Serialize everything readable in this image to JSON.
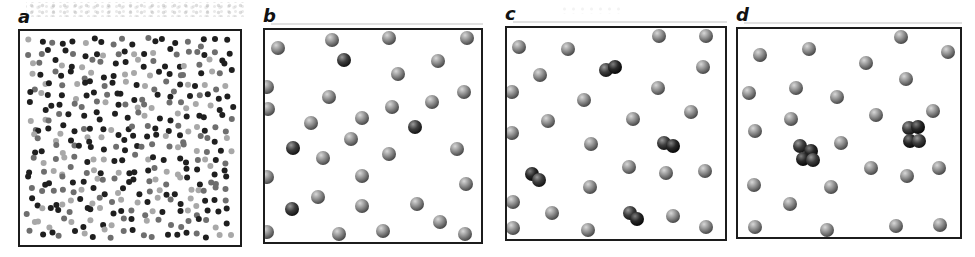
{
  "figure": {
    "width": 975,
    "height": 257,
    "colors": {
      "background": "#ffffff",
      "panel_border": "#1c1c1c",
      "label_color": "#111111",
      "sphere_gray": {
        "hi": "#d8d8d8",
        "mid": "#8f8f8f",
        "lo": "#4a4a4a"
      },
      "sphere_dark": {
        "hi": "#9a9a9a",
        "mid": "#3e3e3e",
        "lo": "#141414"
      },
      "sphere_black": {
        "hi": "#7e7e7e",
        "mid": "#282828",
        "lo": "#080808"
      },
      "dot_shades": [
        "#1f1f1f",
        "#6e6e6e",
        "#a8a8a8"
      ]
    },
    "sphere_radius": 7,
    "panels": [
      {
        "id": "a",
        "label": "a",
        "type": "dense-dot-field",
        "description": "dense random mixture of small dark and light dots",
        "box": {
          "x": 18,
          "y": 29,
          "w": 224,
          "h": 218
        },
        "dots_spec": {
          "cols": 20,
          "rows": 19,
          "seed": 1337,
          "radius": 3,
          "jitter": 4.6,
          "margin": 8,
          "shade_weights": [
            0.4,
            0.34,
            0.26
          ]
        }
      },
      {
        "id": "b",
        "label": "b",
        "type": "sphere-field",
        "description": "dispersed single spheres, four darker monomers",
        "box": {
          "x": 263,
          "y": 28,
          "w": 220,
          "h": 216
        },
        "spheres": [
          [
            15,
            20,
            "g"
          ],
          [
            69,
            12,
            "g"
          ],
          [
            126,
            10,
            "g"
          ],
          [
            204,
            10,
            "g"
          ],
          [
            81,
            32,
            "d"
          ],
          [
            175,
            33,
            "g"
          ],
          [
            135,
            46,
            "g"
          ],
          [
            4,
            59,
            "g"
          ],
          [
            201,
            64,
            "g"
          ],
          [
            66,
            69,
            "g"
          ],
          [
            169,
            74,
            "g"
          ],
          [
            5,
            81,
            "g"
          ],
          [
            129,
            79,
            "g"
          ],
          [
            99,
            90,
            "g"
          ],
          [
            48,
            95,
            "g"
          ],
          [
            152,
            99,
            "d"
          ],
          [
            88,
            111,
            "g"
          ],
          [
            30,
            120,
            "d"
          ],
          [
            60,
            130,
            "g"
          ],
          [
            126,
            126,
            "g"
          ],
          [
            194,
            121,
            "g"
          ],
          [
            4,
            149,
            "g"
          ],
          [
            99,
            148,
            "g"
          ],
          [
            203,
            156,
            "g"
          ],
          [
            55,
            169,
            "g"
          ],
          [
            99,
            178,
            "g"
          ],
          [
            154,
            176,
            "g"
          ],
          [
            29,
            181,
            "d"
          ],
          [
            177,
            194,
            "g"
          ],
          [
            4,
            204,
            "g"
          ],
          [
            76,
            206,
            "g"
          ],
          [
            120,
            203,
            "g"
          ],
          [
            202,
            206,
            "g"
          ]
        ]
      },
      {
        "id": "c",
        "label": "c",
        "type": "sphere-field",
        "description": "dispersed spheres with four dark dimer pairs",
        "box": {
          "x": 505,
          "y": 26,
          "w": 222,
          "h": 215
        },
        "spheres": [
          [
            14,
            21,
            "g"
          ],
          [
            63,
            23,
            "g"
          ],
          [
            154,
            10,
            "g"
          ],
          [
            201,
            10,
            "g"
          ],
          [
            35,
            49,
            "g"
          ],
          [
            198,
            41,
            "g"
          ],
          [
            7,
            66,
            "g"
          ],
          [
            153,
            62,
            "g"
          ],
          [
            79,
            74,
            "g"
          ],
          [
            128,
            93,
            "g"
          ],
          [
            186,
            86,
            "g"
          ],
          [
            43,
            95,
            "g"
          ],
          [
            7,
            107,
            "g"
          ],
          [
            86,
            118,
            "g"
          ],
          [
            124,
            141,
            "g"
          ],
          [
            161,
            147,
            "g"
          ],
          [
            200,
            145,
            "g"
          ],
          [
            85,
            161,
            "g"
          ],
          [
            8,
            176,
            "g"
          ],
          [
            47,
            187,
            "g"
          ],
          [
            168,
            190,
            "g"
          ],
          [
            8,
            202,
            "g"
          ],
          [
            83,
            204,
            "g"
          ],
          [
            201,
            201,
            "g"
          ],
          [
            101,
            44,
            "d"
          ],
          [
            110,
            41,
            "k"
          ],
          [
            159,
            117,
            "d"
          ],
          [
            168,
            120,
            "k"
          ],
          [
            27,
            148,
            "k"
          ],
          [
            34,
            154,
            "d"
          ],
          [
            125,
            187,
            "d"
          ],
          [
            132,
            193,
            "k"
          ]
        ]
      },
      {
        "id": "d",
        "label": "d",
        "type": "sphere-field",
        "description": "dispersed spheres with two dark four-sphere clusters",
        "box": {
          "x": 736,
          "y": 27,
          "w": 226,
          "h": 212
        },
        "spheres": [
          [
            165,
            10,
            "g"
          ],
          [
            24,
            28,
            "g"
          ],
          [
            73,
            22,
            "g"
          ],
          [
            130,
            36,
            "g"
          ],
          [
            212,
            25,
            "g"
          ],
          [
            13,
            66,
            "g"
          ],
          [
            60,
            61,
            "g"
          ],
          [
            101,
            70,
            "g"
          ],
          [
            170,
            52,
            "g"
          ],
          [
            197,
            84,
            "g"
          ],
          [
            55,
            92,
            "g"
          ],
          [
            140,
            88,
            "g"
          ],
          [
            19,
            104,
            "g"
          ],
          [
            105,
            116,
            "g"
          ],
          [
            135,
            141,
            "g"
          ],
          [
            203,
            141,
            "g"
          ],
          [
            171,
            149,
            "g"
          ],
          [
            18,
            158,
            "g"
          ],
          [
            95,
            160,
            "g"
          ],
          [
            54,
            177,
            "g"
          ],
          [
            19,
            200,
            "g"
          ],
          [
            91,
            203,
            "g"
          ],
          [
            160,
            199,
            "g"
          ],
          [
            204,
            198,
            "g"
          ],
          [
            64,
            119,
            "d"
          ],
          [
            75,
            124,
            "k"
          ],
          [
            67,
            132,
            "k"
          ],
          [
            77,
            133,
            "d"
          ],
          [
            173,
            101,
            "d"
          ],
          [
            182,
            100,
            "k"
          ],
          [
            174,
            114,
            "k"
          ],
          [
            183,
            114,
            "d"
          ]
        ]
      }
    ]
  }
}
